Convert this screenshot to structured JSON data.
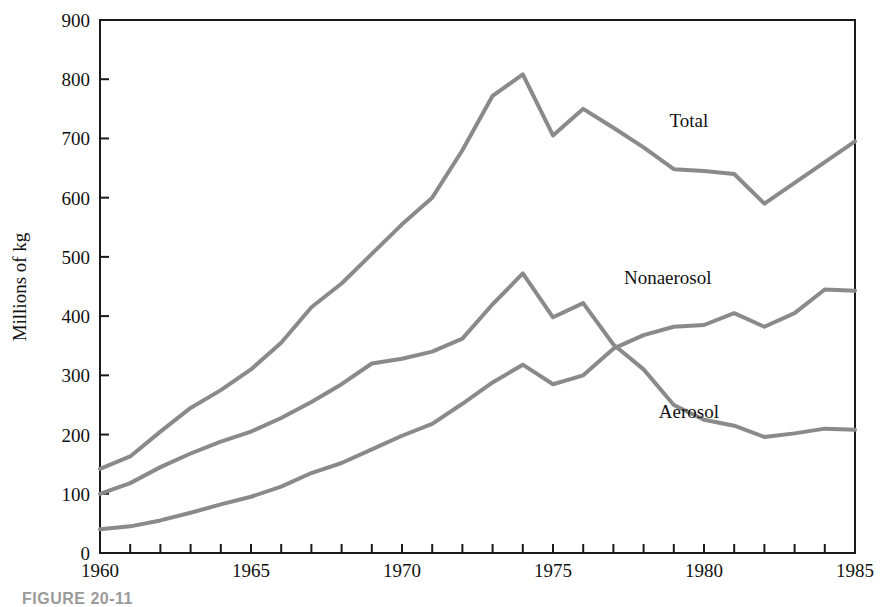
{
  "figure": {
    "caption": "FIGURE 20-11"
  },
  "chart_data": {
    "type": "line",
    "title": "",
    "xlabel": "",
    "ylabel": "Millions of kg",
    "xlim": [
      1960,
      1985
    ],
    "ylim": [
      0,
      900
    ],
    "ytick_values": [
      0,
      100,
      200,
      300,
      400,
      500,
      600,
      700,
      800,
      900
    ],
    "ytick_labels": [
      "0",
      "100",
      "200",
      "300",
      "400",
      "500",
      "600",
      "700",
      "800",
      "900"
    ],
    "xtick_values": [
      1960,
      1961,
      1962,
      1963,
      1964,
      1965,
      1966,
      1967,
      1968,
      1969,
      1970,
      1971,
      1972,
      1973,
      1974,
      1975,
      1976,
      1977,
      1978,
      1979,
      1980,
      1981,
      1982,
      1983,
      1984,
      1985
    ],
    "xtick_labeled": [
      1960,
      1965,
      1970,
      1975,
      1980,
      1985
    ],
    "xtick_labels": [
      "1960",
      "1965",
      "1970",
      "1975",
      "1980",
      "1985"
    ],
    "grid": false,
    "legend_position": "inline-labels",
    "line_color": "#8a8a8a",
    "line_width": 4,
    "x": [
      1960,
      1961,
      1962,
      1963,
      1964,
      1965,
      1966,
      1967,
      1968,
      1969,
      1970,
      1971,
      1972,
      1973,
      1974,
      1975,
      1976,
      1977,
      1978,
      1979,
      1980,
      1981,
      1982,
      1983,
      1984,
      1985
    ],
    "series": [
      {
        "name": "Total",
        "label": "Total",
        "label_x": 1979.5,
        "label_y": 720,
        "values": [
          142,
          163,
          205,
          245,
          275,
          310,
          355,
          415,
          455,
          505,
          555,
          600,
          680,
          772,
          808,
          705,
          750,
          718,
          685,
          648,
          645,
          640,
          590,
          625,
          660,
          695
        ]
      },
      {
        "name": "Nonaerosol",
        "label": "Nonaerosol",
        "label_x": 1978.8,
        "label_y": 455,
        "values": [
          100,
          118,
          145,
          168,
          188,
          205,
          228,
          255,
          285,
          320,
          328,
          340,
          362,
          420,
          472,
          398,
          422,
          352,
          310,
          250,
          225,
          215,
          196,
          202,
          210,
          208
        ]
      },
      {
        "name": "Aerosol",
        "label": "Aerosol",
        "label_x": 1979.5,
        "label_y": 228,
        "values": [
          40,
          45,
          55,
          68,
          82,
          95,
          112,
          135,
          152,
          175,
          198,
          218,
          252,
          288,
          318,
          285,
          300,
          345,
          368,
          382,
          385,
          405,
          382,
          405,
          445,
          443
        ]
      }
    ]
  }
}
